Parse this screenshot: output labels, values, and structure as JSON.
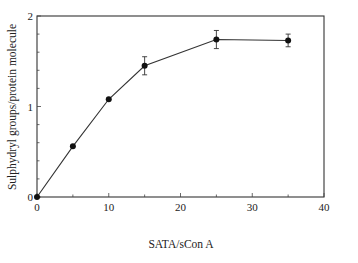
{
  "chart_data": {
    "type": "line",
    "title": "",
    "xlabel": "SATA/sCon A",
    "ylabel": "Sulphydryl groups/protein molecule",
    "xlim": [
      0,
      40
    ],
    "ylim": [
      0,
      2
    ],
    "xticks": [
      0,
      10,
      20,
      30,
      40
    ],
    "yticks": [
      0,
      1,
      2
    ],
    "x_minor_step": 5,
    "y_minor_step": 0.2,
    "grid": false,
    "legend": null,
    "series": [
      {
        "name": "Sulphydryl groups",
        "marker": "filled-circle",
        "x": [
          0,
          5,
          10,
          15,
          25,
          35
        ],
        "values": [
          0,
          0.56,
          1.08,
          1.45,
          1.74,
          1.73
        ],
        "errors": [
          0,
          0,
          0.02,
          0.1,
          0.1,
          0.07
        ]
      }
    ]
  }
}
